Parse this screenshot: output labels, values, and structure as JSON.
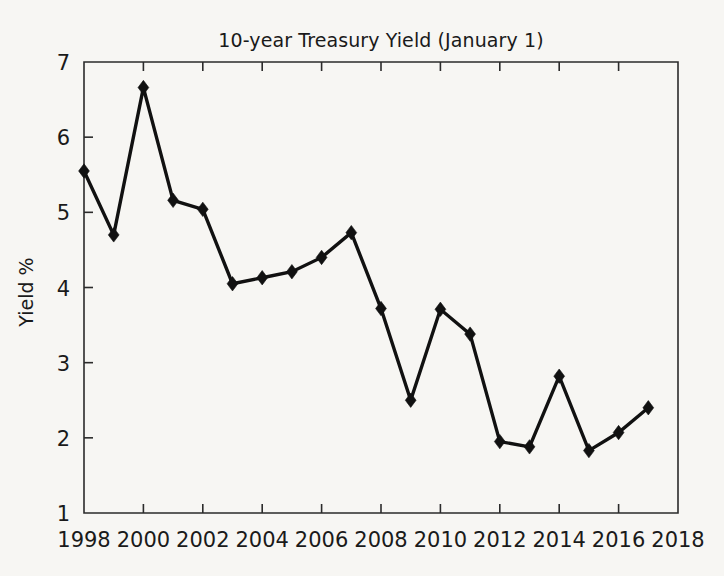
{
  "chart_data": {
    "type": "line",
    "title": "10-year Treasury Yield (January 1)",
    "xlabel": "",
    "ylabel": "Yield %",
    "x": [
      1998,
      1999,
      2000,
      2001,
      2002,
      2003,
      2004,
      2005,
      2006,
      2007,
      2008,
      2009,
      2010,
      2011,
      2012,
      2013,
      2014,
      2015,
      2016,
      2017
    ],
    "values": [
      5.55,
      4.7,
      6.66,
      5.16,
      5.04,
      4.05,
      4.13,
      4.21,
      4.4,
      4.73,
      3.72,
      2.5,
      3.71,
      3.38,
      1.95,
      1.88,
      2.82,
      1.83,
      2.07,
      2.4
    ],
    "series": [
      {
        "name": "10-year Treasury Yield",
        "values": [
          5.55,
          4.7,
          6.66,
          5.16,
          5.04,
          4.05,
          4.13,
          4.21,
          4.4,
          4.73,
          3.72,
          2.5,
          3.71,
          3.38,
          1.95,
          1.88,
          2.82,
          1.83,
          2.07,
          2.4
        ]
      }
    ],
    "xlim": [
      1998,
      2018
    ],
    "ylim": [
      1,
      7
    ],
    "xticks": [
      1998,
      2000,
      2002,
      2004,
      2006,
      2008,
      2010,
      2012,
      2014,
      2016,
      2018
    ],
    "xtick_labels": [
      "1998",
      "2000",
      "2002",
      "2004",
      "2006",
      "2008",
      "2010",
      "2012",
      "2014",
      "2016",
      "2018"
    ],
    "yticks": [
      1,
      2,
      3,
      4,
      5,
      6,
      7
    ],
    "ytick_labels": [
      "1",
      "2",
      "3",
      "4",
      "5",
      "6",
      "7"
    ],
    "grid": false,
    "legend": false,
    "legend_position": "none",
    "marker": "diamond",
    "line_color": "#111111",
    "marker_color": "#111111",
    "background_color": "#f7f6f3",
    "axis_color": "#2b2b2b"
  }
}
